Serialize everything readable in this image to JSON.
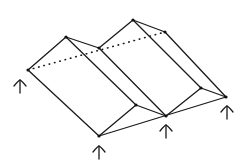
{
  "diagram": {
    "type": "folded-plate-roof-sketch",
    "style": "hand-drawn isometric line sketch",
    "colors": {
      "background": "#ffffff",
      "ink": "#1a1a1a"
    },
    "nodes": [
      {
        "id": "back-left",
        "x": 28,
        "y": 70
      },
      {
        "id": "back-peak-1",
        "x": 66,
        "y": 37
      },
      {
        "id": "back-valley",
        "x": 99,
        "y": 48
      },
      {
        "id": "back-peak-2",
        "x": 133,
        "y": 20
      },
      {
        "id": "back-right",
        "x": 165,
        "y": 32
      },
      {
        "id": "front-left",
        "x": 99,
        "y": 136
      },
      {
        "id": "front-peak-1",
        "x": 136,
        "y": 105
      },
      {
        "id": "front-valley",
        "x": 166,
        "y": 116
      },
      {
        "id": "front-peak-2",
        "x": 201,
        "y": 88
      },
      {
        "id": "front-right",
        "x": 226,
        "y": 97
      }
    ],
    "edges": [
      {
        "from": "back-left",
        "to": "back-peak-1",
        "style": "solid"
      },
      {
        "from": "back-peak-1",
        "to": "back-valley",
        "style": "solid"
      },
      {
        "from": "back-valley",
        "to": "back-peak-2",
        "style": "solid"
      },
      {
        "from": "back-peak-2",
        "to": "back-right",
        "style": "solid"
      },
      {
        "from": "back-left",
        "to": "back-right",
        "style": "dotted"
      },
      {
        "from": "front-left",
        "to": "front-peak-1",
        "style": "solid"
      },
      {
        "from": "front-peak-1",
        "to": "front-valley",
        "style": "solid"
      },
      {
        "from": "front-valley",
        "to": "front-peak-2",
        "style": "solid"
      },
      {
        "from": "front-peak-2",
        "to": "front-right",
        "style": "solid"
      },
      {
        "from": "front-left",
        "to": "front-right",
        "style": "solid"
      },
      {
        "from": "back-left",
        "to": "front-left",
        "style": "solid"
      },
      {
        "from": "back-peak-1",
        "to": "front-peak-1",
        "style": "solid"
      },
      {
        "from": "back-valley",
        "to": "front-valley",
        "style": "solid"
      },
      {
        "from": "back-peak-2",
        "to": "front-peak-2",
        "style": "solid"
      },
      {
        "from": "back-right",
        "to": "front-right",
        "style": "solid"
      }
    ],
    "supports": [
      {
        "id": "support-back-left",
        "x": 20,
        "y": 80
      },
      {
        "id": "support-front-left",
        "x": 99,
        "y": 146
      },
      {
        "id": "support-front-valley",
        "x": 166,
        "y": 125
      },
      {
        "id": "support-front-right",
        "x": 227,
        "y": 106
      }
    ]
  }
}
